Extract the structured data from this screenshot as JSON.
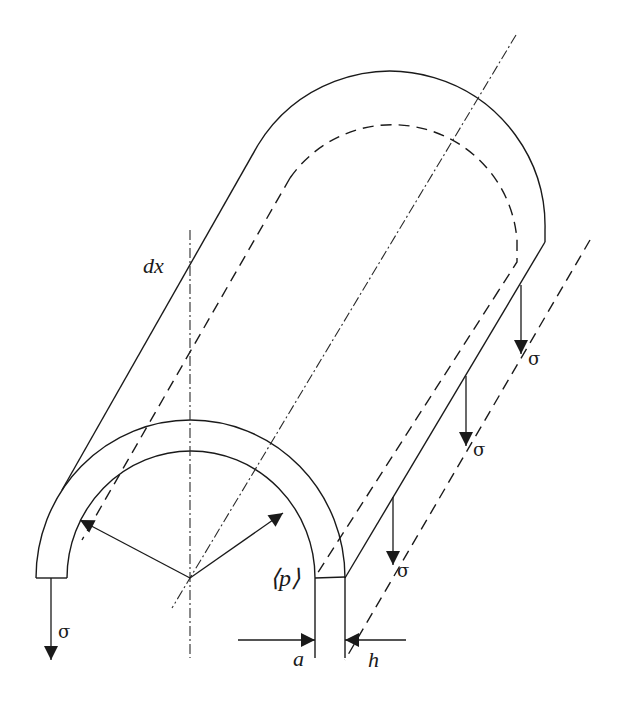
{
  "figure": {
    "labels": {
      "element_length": "dx",
      "pressure": "⟨p⟩",
      "inner_radius": "a",
      "thickness": "h",
      "stress": "σ"
    },
    "stress_arrows": [
      {
        "id": "front-left",
        "label": "σ"
      },
      {
        "id": "edge-1",
        "label": "σ"
      },
      {
        "id": "edge-2",
        "label": "σ"
      },
      {
        "id": "edge-3",
        "label": "σ"
      }
    ],
    "colors": {
      "stroke": "#1a1a1a",
      "background": "#ffffff"
    }
  }
}
